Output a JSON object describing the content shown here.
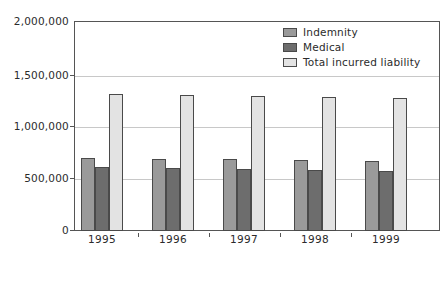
{
  "chart_data": {
    "type": "bar",
    "title": "",
    "subtitle": "",
    "xlabel": "",
    "ylabel": "",
    "categories": [
      "1995",
      "1996",
      "1997",
      "1998",
      "1999"
    ],
    "series": [
      {
        "name": "Indemnity",
        "color": "#9a9a9a",
        "values": [
          700000,
          690000,
          685000,
          675000,
          665000
        ]
      },
      {
        "name": "Medical",
        "color": "#6d6d6d",
        "values": [
          610000,
          600000,
          595000,
          580000,
          570000
        ]
      },
      {
        "name": "Total incurred liability",
        "color": "#e3e3e3",
        "values": [
          1305000,
          1295000,
          1288000,
          1278000,
          1270000
        ]
      }
    ],
    "ylim": [
      0,
      2000000
    ],
    "yticks": [
      0,
      500000,
      1000000,
      1500000,
      2000000
    ],
    "ytick_labels": [
      "0",
      "500,000",
      "1,000,000",
      "1,500,000",
      "2,000,000"
    ],
    "grid": true,
    "legend_position": "top-right",
    "annotations": []
  },
  "legend": {
    "entries": [
      {
        "label": "Indemnity",
        "swatch": "indemnity"
      },
      {
        "label": "Medical",
        "swatch": "medical"
      },
      {
        "label": "Total incurred liability",
        "swatch": "total"
      }
    ]
  },
  "colors": {
    "indemnity": "#9a9a9a",
    "medical": "#6d6d6d",
    "total": "#e3e3e3",
    "axis": "#555555",
    "grid": "#c8c8c8",
    "text": "#2b2b2b",
    "background": "#ffffff"
  }
}
